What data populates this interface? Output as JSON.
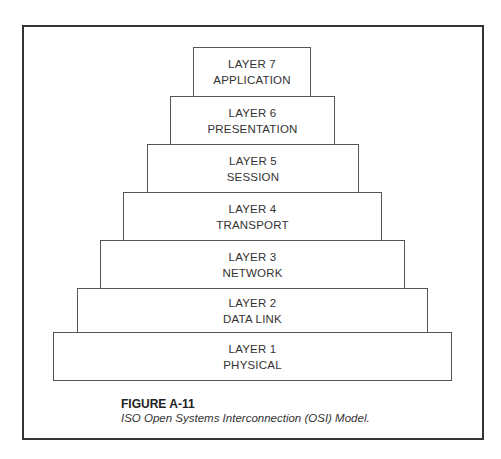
{
  "figure": {
    "number": "FIGURE A-11",
    "title": "ISO Open Systems Interconnection (OSI) Model."
  },
  "layers": [
    {
      "layer": "LAYER 7",
      "name": "APPLICATION",
      "box": [
        193,
        47,
        118,
        50
      ]
    },
    {
      "layer": "LAYER 6",
      "name": "PRESENTATION",
      "box": [
        170,
        96,
        165,
        49
      ]
    },
    {
      "layer": "LAYER 5",
      "name": "SESSION",
      "box": [
        147,
        144,
        212,
        49
      ]
    },
    {
      "layer": "LAYER 4",
      "name": "TRANSPORT",
      "box": [
        123,
        192,
        259,
        49
      ]
    },
    {
      "layer": "LAYER 3",
      "name": "NETWORK",
      "box": [
        100,
        240,
        305,
        49
      ]
    },
    {
      "layer": "LAYER 2",
      "name": "DATA LINK",
      "box": [
        77,
        288,
        351,
        45
      ]
    },
    {
      "layer": "LAYER 1",
      "name": "PHYSICAL",
      "box": [
        53,
        332,
        399,
        49
      ]
    }
  ]
}
